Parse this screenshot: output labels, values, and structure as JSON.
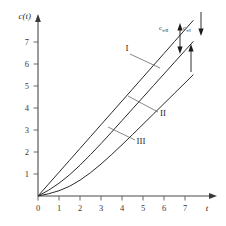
{
  "chart_data": {
    "type": "line",
    "title": "",
    "xlabel": "t",
    "ylabel": "c(t)",
    "xlim": [
      0,
      8.2
    ],
    "ylim": [
      0,
      8.4
    ],
    "grid": false,
    "legend": "inline-labels",
    "x_ticks": [
      "0",
      "1",
      "2",
      "3",
      "4",
      "5",
      "6",
      "7"
    ],
    "x_tick_values": [
      0,
      1,
      2,
      3,
      4,
      5,
      6,
      7
    ],
    "y_ticks": [
      "1",
      "2",
      "3",
      "4",
      "5",
      "6",
      "7"
    ],
    "y_tick_values": [
      1,
      2,
      3,
      4,
      5,
      6,
      7
    ],
    "series": [
      {
        "name": "I",
        "label": "I",
        "description": "straight line through origin, steepest, no lag",
        "x": [
          0,
          0.5,
          1,
          1.5,
          2,
          2.5,
          3,
          3.5,
          4,
          4.5,
          5,
          5.5,
          6,
          6.5,
          7,
          7.4
        ],
        "values": [
          0,
          0.54,
          1.08,
          1.62,
          2.16,
          2.7,
          3.24,
          3.78,
          4.32,
          4.86,
          5.4,
          5.94,
          6.48,
          7.02,
          7.56,
          7.99
        ]
      },
      {
        "name": "II",
        "label": "II",
        "description": "curve with short induction period approaching straight asymptote below curve I",
        "x": [
          0,
          0.5,
          1,
          1.5,
          2,
          2.5,
          3,
          3.5,
          4,
          4.5,
          5,
          5.5,
          6,
          6.5,
          7,
          7.4
        ],
        "values": [
          0,
          0.26,
          0.58,
          0.96,
          1.4,
          1.88,
          2.38,
          2.9,
          3.43,
          3.96,
          4.49,
          5.02,
          5.55,
          6.08,
          6.61,
          7.03
        ]
      },
      {
        "name": "III",
        "label": "III",
        "description": "curve with long induction period, lowest, approaching straight asymptote",
        "x": [
          0,
          0.5,
          1,
          1.5,
          2,
          2.5,
          3,
          3.5,
          4,
          4.5,
          5,
          5.5,
          6,
          6.5,
          7,
          7.4
        ],
        "values": [
          0,
          0.1,
          0.24,
          0.44,
          0.72,
          1.06,
          1.45,
          1.88,
          2.33,
          2.79,
          3.26,
          3.73,
          4.2,
          4.67,
          5.14,
          5.52
        ]
      }
    ],
    "annotations": [
      {
        "name": "asymptote-offset-II",
        "label": "c",
        "sub_infinity": "∞",
        "sub_roman": "II",
        "text": "c∞II",
        "description": "double arrow marking vertical offset between curve I and curve II asymptote"
      },
      {
        "name": "asymptote-offset-I",
        "label": "c",
        "sub_infinity": "∞",
        "sub_roman": "I",
        "text": "c∞I",
        "description": "double arrow marking vertical offset between curve I and curve III asymptote"
      }
    ]
  },
  "axes": {
    "y_axis_title": "c(t)",
    "x_axis_title": "t",
    "origin_label": "0"
  },
  "curve_labels": {
    "one": "I",
    "two": "II",
    "three": "III"
  },
  "asymptote_labels": {
    "left_base": "c",
    "left_sub": "∞II",
    "right_base": "c",
    "right_sub": "∞I"
  },
  "colors": {
    "curve": "#2b2b2b",
    "axis": "#4a4a4a",
    "text": "#2a2a2a",
    "background": "#ffffff"
  }
}
